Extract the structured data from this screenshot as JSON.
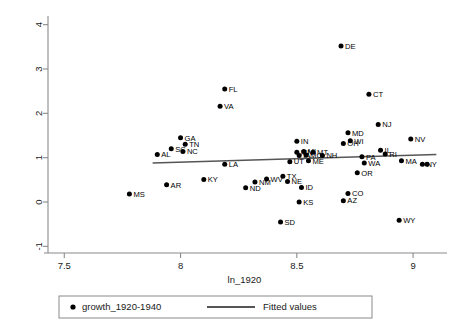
{
  "chart_data": {
    "type": "scatter",
    "title": "",
    "xlabel": "ln_1920",
    "ylabel": "",
    "xlim": [
      7.43,
      9.12
    ],
    "ylim": [
      -1.15,
      4.15
    ],
    "xticks": [
      "7.5",
      "8",
      "8.5",
      "9"
    ],
    "xtick_values": [
      7.5,
      8,
      8.5,
      9
    ],
    "yticks": [
      "-1",
      "0",
      "1",
      "2",
      "3",
      "4"
    ],
    "ytick_values": [
      -1,
      0,
      1,
      2,
      3,
      4
    ],
    "grid": false,
    "legend_position": "below",
    "legend": [
      {
        "marker": "dot",
        "label": "growth_1920-1940"
      },
      {
        "marker": "line",
        "label": "Fitted values"
      }
    ],
    "series": [
      {
        "name": "growth_1920-1940",
        "marker": "filled-circle",
        "color": "#000000",
        "points": [
          {
            "label": "MS",
            "x": 7.78,
            "y": 0.18
          },
          {
            "label": "AL",
            "x": 7.9,
            "y": 1.07
          },
          {
            "label": "AR",
            "x": 7.94,
            "y": 0.39
          },
          {
            "label": "SC",
            "x": 7.96,
            "y": 1.2
          },
          {
            "label": "GA",
            "x": 8.0,
            "y": 1.45
          },
          {
            "label": "NC",
            "x": 8.01,
            "y": 1.14
          },
          {
            "label": "TN",
            "x": 8.02,
            "y": 1.3
          },
          {
            "label": "KY",
            "x": 8.1,
            "y": 0.51
          },
          {
            "label": "VA",
            "x": 8.17,
            "y": 2.16
          },
          {
            "label": "FL",
            "x": 8.19,
            "y": 2.55
          },
          {
            "label": "LA",
            "x": 8.19,
            "y": 0.85
          },
          {
            "label": "ND",
            "x": 8.28,
            "y": 0.32
          },
          {
            "label": "NM",
            "x": 8.32,
            "y": 0.45
          },
          {
            "label": "WV",
            "x": 8.37,
            "y": 0.52
          },
          {
            "label": "SD",
            "x": 8.43,
            "y": -0.45
          },
          {
            "label": "TX",
            "x": 8.44,
            "y": 0.58
          },
          {
            "label": "NE",
            "x": 8.46,
            "y": 0.46
          },
          {
            "label": "UT",
            "x": 8.47,
            "y": 0.91
          },
          {
            "label": "IN",
            "x": 8.5,
            "y": 1.37
          },
          {
            "label": "MN",
            "x": 8.5,
            "y": 1.12
          },
          {
            "label": "IA",
            "x": 8.51,
            "y": 1.05
          },
          {
            "label": "KS",
            "x": 8.51,
            "y": 0.0
          },
          {
            "label": "ID",
            "x": 8.52,
            "y": 0.33
          },
          {
            "label": "MI",
            "x": 8.53,
            "y": 1.14
          },
          {
            "label": "MO",
            "x": 8.54,
            "y": 1.06
          },
          {
            "label": "ME",
            "x": 8.55,
            "y": 0.93
          },
          {
            "label": "MT",
            "x": 8.57,
            "y": 1.12
          },
          {
            "label": "NH",
            "x": 8.61,
            "y": 1.05
          },
          {
            "label": "DE",
            "x": 8.69,
            "y": 3.52
          },
          {
            "label": "OH",
            "x": 8.7,
            "y": 1.32
          },
          {
            "label": "MD",
            "x": 8.72,
            "y": 1.56
          },
          {
            "label": "WI",
            "x": 8.73,
            "y": 1.38
          },
          {
            "label": "CO",
            "x": 8.72,
            "y": 0.19
          },
          {
            "label": "AZ",
            "x": 8.7,
            "y": 0.03
          },
          {
            "label": "OR",
            "x": 8.76,
            "y": 0.66
          },
          {
            "label": "PA",
            "x": 8.78,
            "y": 1.02
          },
          {
            "label": "WA",
            "x": 8.79,
            "y": 0.88
          },
          {
            "label": "CT",
            "x": 8.81,
            "y": 2.43
          },
          {
            "label": "NJ",
            "x": 8.85,
            "y": 1.75
          },
          {
            "label": "IL",
            "x": 8.86,
            "y": 1.17
          },
          {
            "label": "RI",
            "x": 8.88,
            "y": 1.08
          },
          {
            "label": "WY",
            "x": 8.94,
            "y": -0.41
          },
          {
            "label": "MA",
            "x": 8.95,
            "y": 0.93
          },
          {
            "label": "NV",
            "x": 8.99,
            "y": 1.42
          },
          {
            "label": "NY",
            "x": 9.04,
            "y": 0.85
          },
          {
            "label": "",
            "x": 9.06,
            "y": 0.85
          }
        ]
      }
    ],
    "fit": {
      "name": "Fitted values",
      "color": "#555555",
      "x0": 7.88,
      "y0": 0.88,
      "x1": 9.1,
      "y1": 1.07
    }
  }
}
